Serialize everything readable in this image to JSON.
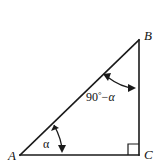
{
  "figure": {
    "kind": "geometry-diagram",
    "background_color": "#ffffff",
    "stroke_color": "#1a1a1a",
    "text_color": "#111111"
  },
  "vertices": [
    {
      "id": "A",
      "label": "A",
      "x": 20,
      "y": 155,
      "label_x": 8,
      "label_y": 160
    },
    {
      "id": "B",
      "label": "B",
      "x": 139,
      "y": 40,
      "label_x": 144,
      "label_y": 40
    },
    {
      "id": "C",
      "label": "C",
      "x": 139,
      "y": 155,
      "label_x": 144,
      "label_y": 159
    }
  ],
  "edges": [
    {
      "id": "base",
      "from": "A",
      "to": "C"
    },
    {
      "id": "vertical",
      "from": "C",
      "to": "B"
    },
    {
      "id": "hypotenuse",
      "from": "A",
      "to": "B"
    }
  ],
  "angles": [
    {
      "id": "angle-a",
      "at": "A",
      "label": "α",
      "label_x": 46,
      "label_y": 148,
      "marker": "double-arrow-arc"
    },
    {
      "id": "angle-b",
      "at": "B",
      "label_parts": {
        "value": "90",
        "degree": "°",
        "minus": "−",
        "symbol": "α"
      },
      "label": "90° − α",
      "label_x": 86,
      "label_y": 101,
      "marker": "double-arrow-arc"
    },
    {
      "id": "angle-c",
      "at": "C",
      "label": "",
      "marker": "right-angle-square",
      "size": 11
    }
  ]
}
